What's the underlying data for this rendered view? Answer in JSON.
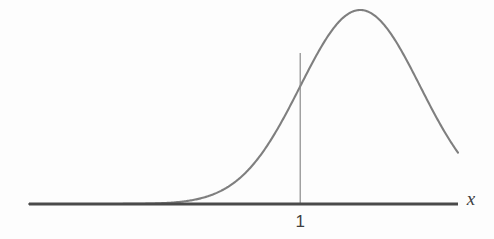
{
  "figure": {
    "background_color": "#fdfdfd",
    "width": 494,
    "height": 239,
    "axis_label_x": "x",
    "tick_label_1": "1"
  },
  "chart_data": {
    "type": "line",
    "title": "",
    "subtitle": "",
    "xlabel": "x",
    "ylabel": "",
    "grid": false,
    "legend": null,
    "annotations": [
      {
        "name": "vertical-drop-line",
        "x": 1,
        "from_y": 0,
        "to_y": 0.7788,
        "label": "1",
        "description": "Vertical line segment from the x-axis at x = 1 up to the bell curve"
      }
    ],
    "axis": {
      "x_axis_drawn": true,
      "y_axis_drawn": false,
      "x_tick_values": [
        1
      ],
      "x_tick_labels": [
        "1"
      ],
      "xlim": [
        -3.52,
        3.63
      ],
      "ylim": [
        0,
        1.06
      ]
    },
    "series": [
      {
        "name": "normal-density-curve",
        "color": "#7f7f7f",
        "linewidth": 2,
        "description": "Bell-shaped (Gaussian) curve, peak centred at x = 2, standard deviation 1, drawn unnormalised with peak height 1",
        "peak_x": 2,
        "peak_y": 1,
        "mean": 2,
        "stddev": 1,
        "x": [
          -3.52,
          -3.2,
          -2.8,
          -2.4,
          -2.0,
          -1.6,
          -1.2,
          -0.8,
          -0.4,
          0.0,
          0.4,
          0.8,
          1.0,
          1.2,
          1.6,
          2.0,
          2.4,
          2.8,
          3.2,
          3.63
        ],
        "y": [
          0.0,
          0.0,
          0.0,
          0.001,
          0.0003,
          0.0018,
          0.0091,
          0.0342,
          0.0992,
          0.2369,
          0.4449,
          0.6977,
          0.7788,
          0.8521,
          0.9231,
          1.0,
          0.9231,
          0.8521,
          0.6977,
          0.4449
        ]
      }
    ],
    "colors": {
      "curve": "#7f7f7f",
      "axis": "#4a4a4a",
      "drop_line": "#8a8a8a",
      "text": "#3f3f3f"
    }
  }
}
